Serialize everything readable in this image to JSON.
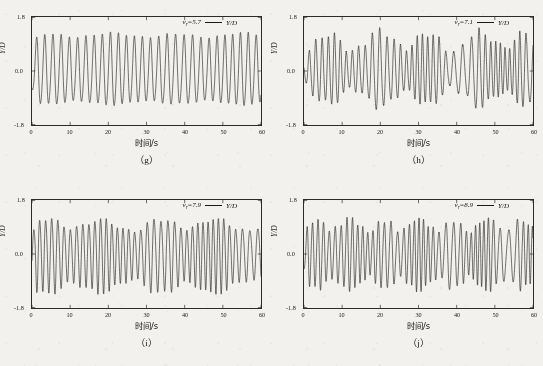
{
  "figure": {
    "background_color": "#f3f1ee",
    "line_color": "#1a1a1a",
    "axis_color": "#2b2b2b"
  },
  "axes": {
    "xlabel": "时间/s",
    "ylabel": "Y/D",
    "xticks": [
      "0",
      "10",
      "20",
      "30",
      "40",
      "50",
      "60"
    ],
    "yticks": [
      "1.8",
      "0.0",
      "-1.8"
    ],
    "xlim": [
      0,
      60
    ],
    "ylim": [
      -1.8,
      1.8
    ]
  },
  "panels": [
    {
      "tag": "（g）",
      "legend_param": "v",
      "legend_sub": "r",
      "legend_value": "=5.7",
      "series_label": "Y/D"
    },
    {
      "tag": "（h）",
      "legend_param": "v",
      "legend_sub": "r",
      "legend_value": "=7.1",
      "series_label": "Y/D"
    },
    {
      "tag": "（i）",
      "legend_param": "v",
      "legend_sub": "r",
      "legend_value": "=7.9",
      "series_label": "Y/D"
    },
    {
      "tag": "（j）",
      "legend_param": "v",
      "legend_sub": "r",
      "legend_value": "=8.9",
      "series_label": "Y/D"
    }
  ],
  "chart_data": [
    {
      "type": "line",
      "title": "(g) vr=5.7",
      "xlabel": "时间/s",
      "ylabel": "Y/D",
      "xlim": [
        0,
        60
      ],
      "ylim": [
        -1.8,
        1.8
      ],
      "grid": false,
      "legend": "Y/D",
      "legend_position": "top-right",
      "annotation": "vr=5.7",
      "reduced_velocity": 5.7,
      "waveform": {
        "description": "near-steady periodic lock-in oscillation",
        "frequency_hz": 0.467,
        "cycles_over_60s": 28,
        "mean": 0.0,
        "amplitude_mean": 1.12,
        "amplitude_min": 1.0,
        "amplitude_max": 1.22,
        "modulation_depth": 0.09,
        "modulation_period_s": 17,
        "startup_transient_s": 1.5
      }
    },
    {
      "type": "line",
      "title": "(h) vr=7.1",
      "xlabel": "时间/s",
      "ylabel": "Y/D",
      "xlim": [
        0,
        60
      ],
      "ylim": [
        -1.8,
        1.8
      ],
      "grid": false,
      "legend": "Y/D",
      "legend_position": "top-right",
      "annotation": "vr=7.1",
      "reduced_velocity": 7.1,
      "waveform": {
        "description": "strongly beat-modulated oscillation with amplitude collapse near t=30-38 s",
        "frequency_hz": 0.6,
        "cycles_over_60s": 36,
        "mean": 0.0,
        "amplitude_mean": 0.95,
        "amplitude_min": 0.42,
        "amplitude_max": 1.35,
        "modulation_depth": 0.48,
        "modulation_period_s": 13,
        "startup_transient_s": 1.5
      }
    },
    {
      "type": "line",
      "title": "(i) vr=7.9",
      "xlabel": "时间/s",
      "ylabel": "Y/D",
      "xlim": [
        0,
        60
      ],
      "ylim": [
        -1.8,
        1.8
      ],
      "grid": false,
      "legend": "Y/D",
      "legend_position": "top-right",
      "annotation": "vr=7.9",
      "reduced_velocity": 7.9,
      "waveform": {
        "description": "quasi-periodic oscillation with mild beating and a dip near t=33 s",
        "frequency_hz": 0.633,
        "cycles_over_60s": 38,
        "mean": 0.0,
        "amplitude_mean": 1.05,
        "amplitude_min": 0.62,
        "amplitude_max": 1.25,
        "modulation_depth": 0.3,
        "modulation_period_s": 15,
        "startup_transient_s": 1.2
      }
    },
    {
      "type": "line",
      "title": "(j) vr=8.9",
      "xlabel": "时间/s",
      "ylabel": "Y/D",
      "xlim": [
        0,
        60
      ],
      "ylim": [
        -1.8,
        1.8
      ],
      "grid": false,
      "legend": "Y/D",
      "legend_position": "top-right",
      "annotation": "vr=8.9",
      "reduced_velocity": 8.9,
      "waveform": {
        "description": "irregular multi-frequency oscillation with dense beating",
        "frequency_hz": 0.683,
        "cycles_over_60s": 41,
        "mean": 0.0,
        "amplitude_mean": 0.98,
        "amplitude_min": 0.55,
        "amplitude_max": 1.22,
        "modulation_depth": 0.34,
        "modulation_period_s": 9,
        "startup_transient_s": 1.0
      }
    }
  ]
}
